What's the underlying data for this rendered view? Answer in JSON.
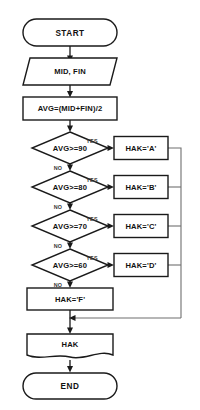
{
  "diagram": {
    "type": "flowchart",
    "background_color": "#ffffff",
    "line_color": "#1a1a1a",
    "bus_line_color": "#6f6f6f",
    "nodes": {
      "start": {
        "label": "START",
        "shape": "terminator"
      },
      "input": {
        "label": "MID, FIN",
        "shape": "parallelogram-input"
      },
      "process_avg": {
        "label": "AVG=(MID+FIN)/2",
        "shape": "process-rectangle"
      },
      "decision_90": {
        "label": "AVG>=90",
        "shape": "decision-diamond"
      },
      "decision_80": {
        "label": "AVG>=80",
        "shape": "decision-diamond"
      },
      "decision_70": {
        "label": "AVG>=70",
        "shape": "decision-diamond"
      },
      "decision_60": {
        "label": "AVG>=60",
        "shape": "decision-diamond"
      },
      "grade_a": {
        "label": "HAK='A'",
        "shape": "process-rectangle"
      },
      "grade_b": {
        "label": "HAK='B'",
        "shape": "process-rectangle"
      },
      "grade_c": {
        "label": "HAK='C'",
        "shape": "process-rectangle"
      },
      "grade_d": {
        "label": "HAK='D'",
        "shape": "process-rectangle"
      },
      "grade_f": {
        "label": "HAK='F'",
        "shape": "process-rectangle"
      },
      "output": {
        "label": "HAK",
        "shape": "document"
      },
      "end": {
        "label": "END",
        "shape": "terminator"
      }
    },
    "edge_labels": {
      "yes_90": "YES",
      "yes_80": "YES",
      "yes_70": "YES",
      "yes_60": "YES",
      "no_90": "NO",
      "no_80": "NO",
      "no_70": "NO",
      "no_60": "NO"
    }
  }
}
